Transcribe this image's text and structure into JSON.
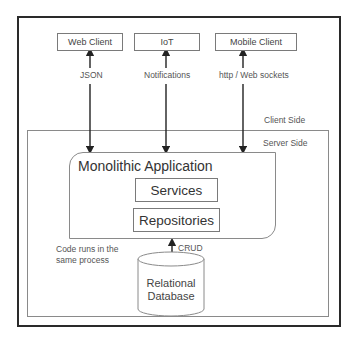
{
  "diagram": {
    "zones": {
      "client_side": "Client Side",
      "server_side": "Server Side"
    },
    "clients": [
      {
        "label": "Web Client",
        "protocol": "JSON"
      },
      {
        "label": "IoT",
        "protocol": "Notifications"
      },
      {
        "label": "Mobile Client",
        "protocol": "http / Web sockets"
      }
    ],
    "application": {
      "title": "Monolithic Application",
      "layers": [
        "Services",
        "Repositories"
      ]
    },
    "note": {
      "line1": "Code runs in the",
      "line2": "same process"
    },
    "database": {
      "line1": "Relational",
      "line2": "Database",
      "link_label": "CRUD"
    },
    "colors": {
      "outer_border": "#2a2a2a",
      "inner_border": "#8a8a8a",
      "arrow": "#222222",
      "text": "#333333"
    }
  }
}
